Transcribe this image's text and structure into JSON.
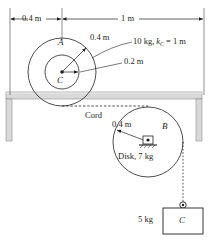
{
  "figure": {
    "type": "engineering-mechanics-diagram"
  },
  "dimensions": {
    "span_left": "0.4 m",
    "span_right": "1 m",
    "pulley_outer_radius": "0.4 m",
    "pulley_inner_radius": "0.2 m",
    "disk_radius": "0.4 m"
  },
  "labels": {
    "pulley_name": "A",
    "pulley_center": "C",
    "pulley_spec": "10 kg,",
    "pulley_k_symbol": "k",
    "pulley_k_sub": "C",
    "pulley_k_value": "= 1 m",
    "cord": "Cord",
    "disk_name": "B",
    "disk_spec": "Disk, 7 kg",
    "block_mass": "5 kg",
    "block_name": "C"
  },
  "colors": {
    "ink": "#231f20",
    "beam_fill": "#d9d9d9",
    "beam_stroke": "#a6a6a6",
    "line": "#58595b"
  }
}
